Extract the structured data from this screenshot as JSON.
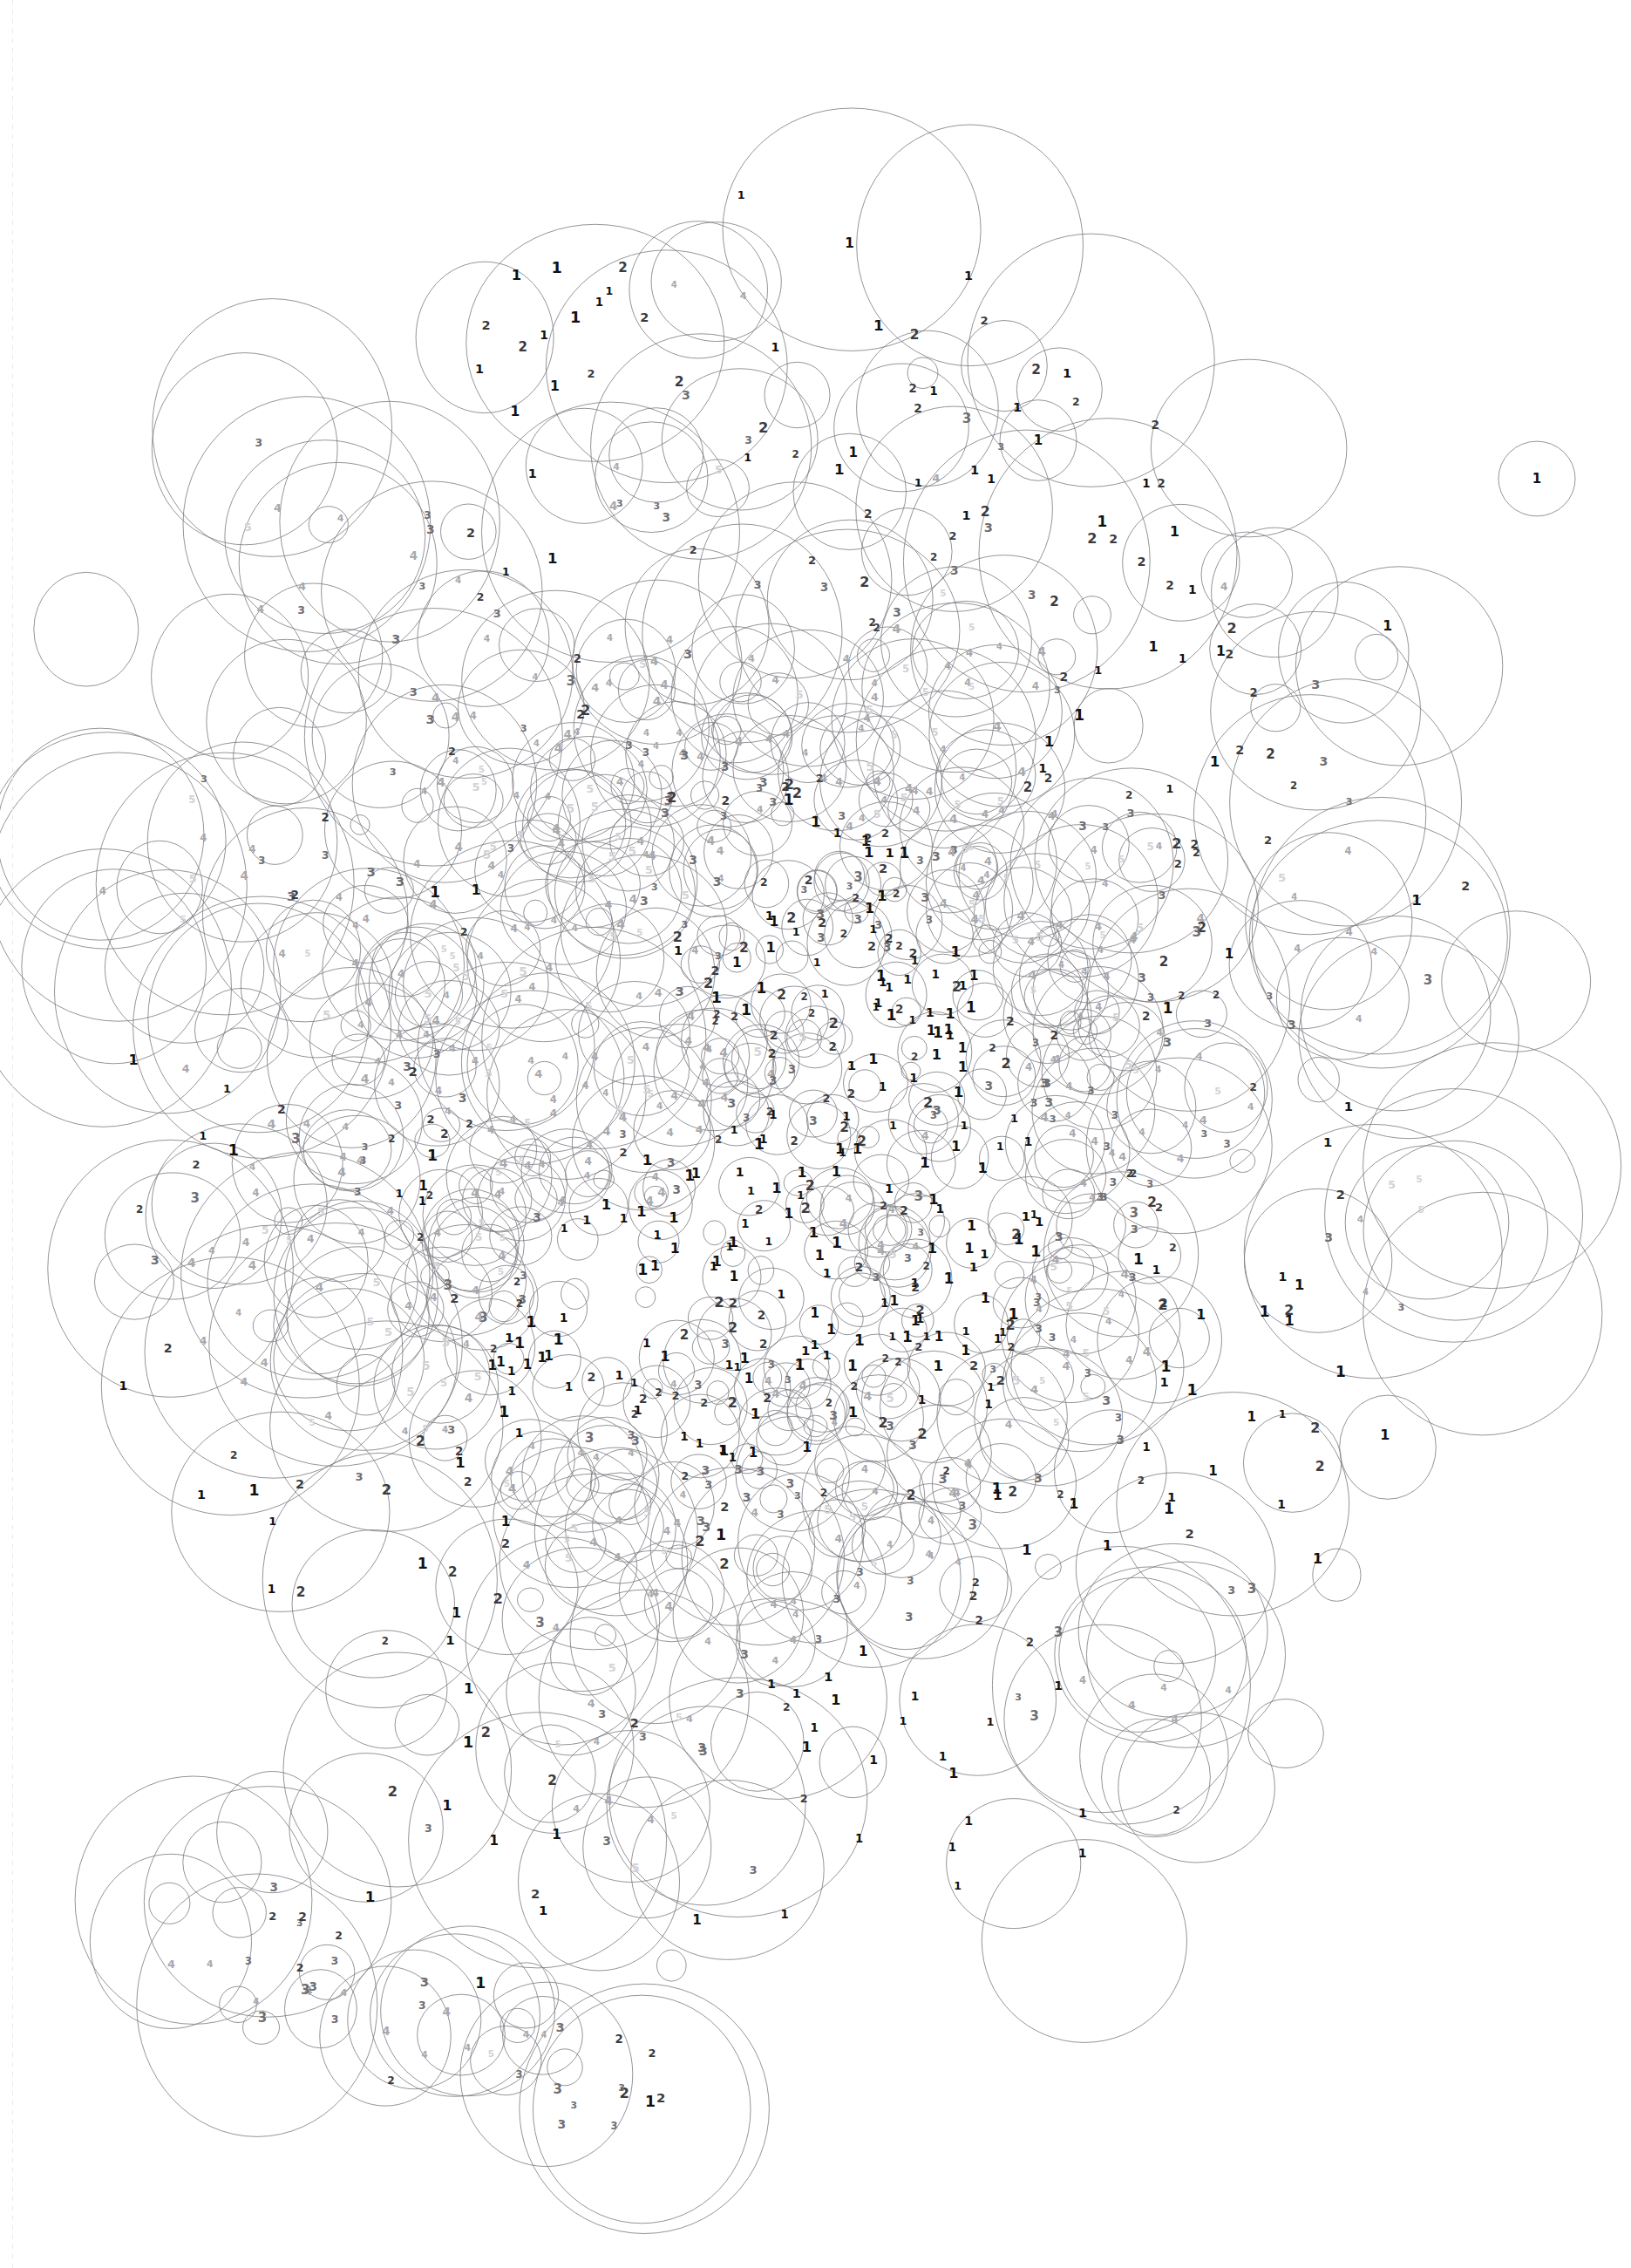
{
  "artwork": {
    "title": "Overlapping Circle Depth Map",
    "width": 1871,
    "height": 2601,
    "background_color": "#ffffff",
    "stroke_color": "#7a7a80",
    "stroke_width": 0.8,
    "margin_rule": {
      "x": 14,
      "color": "#e9e9ec",
      "style": "dashed-vertical"
    }
  },
  "legend": {
    "description": "Each numeral marks the overlap depth of the region it sits in. Darker numerals indicate lower depth.",
    "depth_levels": [
      {
        "value": "1",
        "color": "#111111",
        "font_size": 15,
        "weight": 700
      },
      {
        "value": "2",
        "color": "#3b3b3f",
        "font_size": 14,
        "weight": 700
      },
      {
        "value": "3",
        "color": "#6e6e73",
        "font_size": 13,
        "weight": 700
      },
      {
        "value": "4",
        "color": "#a8a8ad",
        "font_size": 12,
        "weight": 700
      },
      {
        "value": "5",
        "color": "#d2d2d6",
        "font_size": 12,
        "weight": 700
      }
    ]
  },
  "chart_data": {
    "type": "scatter",
    "xlabel": "",
    "ylabel": "",
    "xlim": [
      0,
      1871
    ],
    "ylim": [
      0,
      2601
    ],
    "grid": false,
    "legend_position": "none",
    "point_count": 640,
    "label_count": 1180,
    "radius_range": [
      11,
      148
    ],
    "series": [
      {
        "name": "circles",
        "encoding": "cx, cy, r",
        "note": "Circle outlines; positions follow a dense elliptical blob with a sparse halo and a trailing chain toward the lower-left."
      },
      {
        "name": "depth-labels",
        "encoding": "x, y, depth",
        "note": "Numerals 1-5 placed in circle-overlap regions; depth value maps to gray level."
      }
    ],
    "density_field": {
      "core": {
        "cx": 880,
        "cy": 1300,
        "rx": 560,
        "ry": 620,
        "weight": 1.0
      },
      "inner_void": {
        "cx": 700,
        "cy": 1180,
        "rx": 210,
        "ry": 250,
        "weight": 0.12
      },
      "halo": {
        "cx": 880,
        "cy": 1250,
        "rx": 880,
        "ry": 1080,
        "weight": 0.3
      },
      "tail": {
        "from": [
          250,
          2210
        ],
        "to": [
          720,
          2400
        ],
        "weight": 0.35
      }
    },
    "depth_distribution": {
      "1": 0.34,
      "2": 0.25,
      "3": 0.17,
      "4": 0.14,
      "5": 0.1
    }
  },
  "regions": [
    {
      "name": "upper-arc",
      "depth_hint": "1-2",
      "note": "Sparse ring of large circles forming the top boundary."
    },
    {
      "name": "left-flank",
      "depth_hint": "1-2",
      "note": "Medium circles along the left edge."
    },
    {
      "name": "dense-core",
      "depth_hint": "2-5",
      "note": "Heavy overlap; numerals reach 4 and 5."
    },
    {
      "name": "central-void",
      "depth_hint": "1",
      "note": "Large open circles, little overlap."
    },
    {
      "name": "right-flank",
      "depth_hint": "1-3",
      "note": "Scattered circles thinning toward the right margin."
    },
    {
      "name": "lower-tail",
      "depth_hint": "1-4",
      "note": "Chain of shrinking circles running to the lower-left corner."
    }
  ],
  "isolated_marks": [
    {
      "label": "1",
      "x": 1763,
      "y": 549,
      "note": "Lone circle at the right margin."
    },
    {
      "label": "1",
      "x": 1191,
      "y": 505,
      "note": "Lone circle above the right flank."
    }
  ]
}
